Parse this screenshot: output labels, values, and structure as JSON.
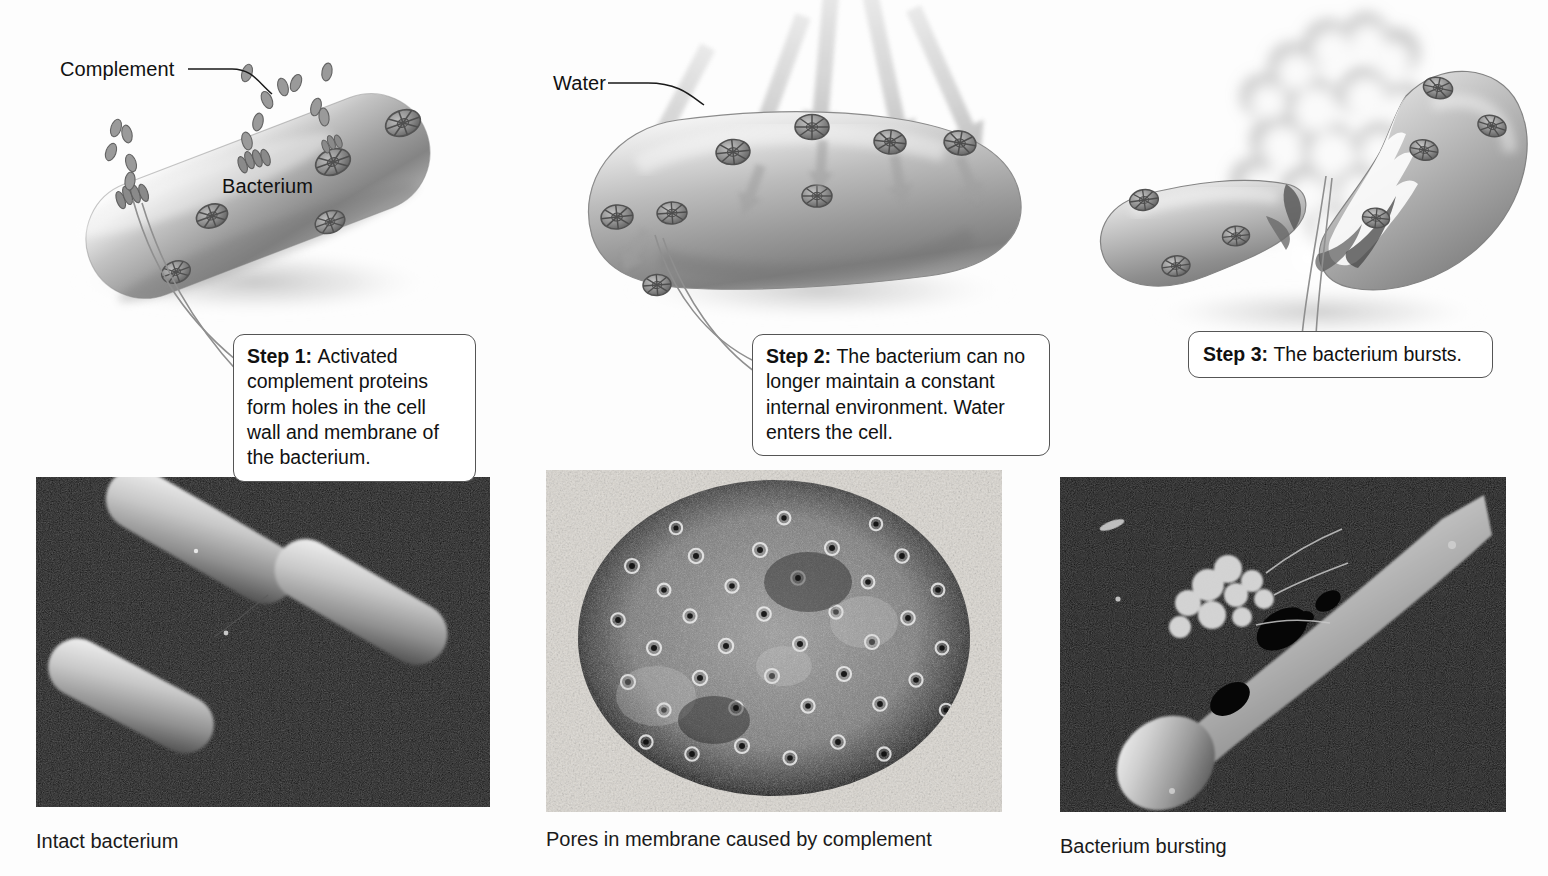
{
  "figure": {
    "background_color": "#fdfdfd"
  },
  "labels": {
    "complement": "Complement",
    "bacterium": "Bacterium",
    "water": "Water"
  },
  "steps": [
    {
      "number": "Step 1:",
      "text": "Activated complement proteins form holes in the cell wall and membrane of the bacterium."
    },
    {
      "number": "Step 2:",
      "text": "The bacterium can no longer maintain a constant internal environment. Water enters the cell."
    },
    {
      "number": "Step 3:",
      "text": "The bacterium bursts."
    }
  ],
  "photos": [
    {
      "caption": "Intact bacterium",
      "kind": "sem-micrograph"
    },
    {
      "caption": "Pores in membrane caused by complement",
      "kind": "tem-micrograph"
    },
    {
      "caption": "Bacterium bursting",
      "kind": "sem-micrograph"
    }
  ],
  "colors": {
    "text": "#111111",
    "callout_border": "#555555",
    "callout_fill": "#ffffff",
    "cell_body_light": "#f1f1f1",
    "cell_body_mid": "#b9b9b9",
    "cell_body_dark": "#7c7c7c",
    "pore": "#6b6b6b",
    "arrow": "#d3d3d3",
    "photo_background": "#050505"
  }
}
